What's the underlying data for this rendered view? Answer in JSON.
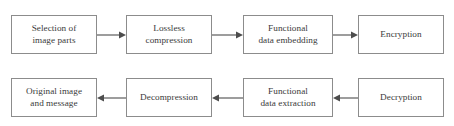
{
  "diagram": {
    "colors": {
      "background": "#ffffff",
      "box_border": "#8c8c8c",
      "box_fill": "#ffffff",
      "text": "#3a3a3a",
      "arrow": "#4d4d4d"
    },
    "rows": [
      {
        "name": "embedding-pipeline",
        "direction": "left-to-right",
        "nodes": [
          {
            "id": "selection-of-image-parts",
            "label": "Selection of\nimage parts"
          },
          {
            "id": "lossless-compression",
            "label": "Lossless\ncompression"
          },
          {
            "id": "functional-data-embedding",
            "label": "Functional\ndata embedding"
          },
          {
            "id": "encryption",
            "label": "Encryption"
          }
        ],
        "arrows": [
          {
            "from": "selection-of-image-parts",
            "to": "lossless-compression",
            "direction": "right"
          },
          {
            "from": "lossless-compression",
            "to": "functional-data-embedding",
            "direction": "right"
          },
          {
            "from": "functional-data-embedding",
            "to": "encryption",
            "direction": "right"
          }
        ]
      },
      {
        "name": "extraction-pipeline",
        "direction": "right-to-left",
        "nodes": [
          {
            "id": "original-image-and-message",
            "label": "Original image\nand message"
          },
          {
            "id": "decompression",
            "label": "Decompression"
          },
          {
            "id": "functional-data-extraction",
            "label": "Functional\ndata extraction"
          },
          {
            "id": "decryption",
            "label": "Decryption"
          }
        ],
        "arrows": [
          {
            "from": "decompression",
            "to": "original-image-and-message",
            "direction": "left"
          },
          {
            "from": "functional-data-extraction",
            "to": "decompression",
            "direction": "left"
          },
          {
            "from": "decryption",
            "to": "functional-data-extraction",
            "direction": "left"
          }
        ]
      }
    ]
  }
}
